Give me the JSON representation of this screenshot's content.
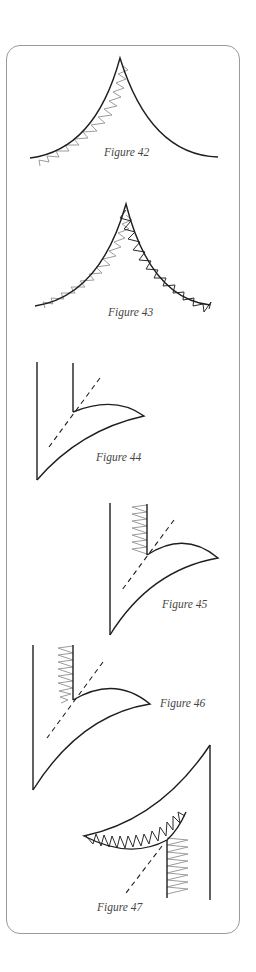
{
  "figures": [
    {
      "id": 42,
      "caption": "Figure 42",
      "description": "Concave curved point with gray zigzag stitching along left curve"
    },
    {
      "id": 43,
      "caption": "Figure 43",
      "description": "Concave curved point with gray zigzag on left curve and dark zigzag on right curve"
    },
    {
      "id": 44,
      "caption": "Figure 44",
      "description": "Appliqué corner with curved edge and dashed guideline"
    },
    {
      "id": 45,
      "caption": "Figure 45",
      "description": "Appliqué corner with gray vertical zigzag stitching and dashed guideline"
    },
    {
      "id": 46,
      "caption": "Figure 46",
      "description": "Appliqué corner with gray vertical zigzag stitching tapering into the curve"
    },
    {
      "id": 47,
      "caption": "Figure 47",
      "description": "Rotated appliqué corner with dark zigzag along curve and gray vertical zigzag"
    }
  ],
  "colors": {
    "frame": "#9a9a9a",
    "outline": "#1e1e1e",
    "stitch_gray": "#9c9c9c",
    "stitch_dark": "#2a2a2a",
    "caption": "#444444"
  }
}
